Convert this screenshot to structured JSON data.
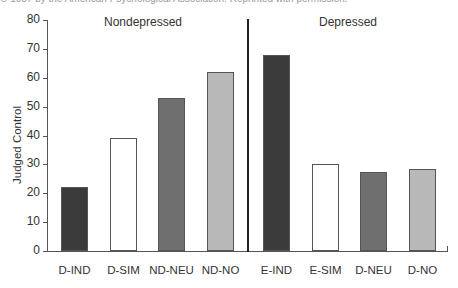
{
  "caption": "© 1987 by the American Psychological Association. Reprinted with permission.",
  "chart_data": {
    "type": "bar",
    "title": "",
    "xlabel": "",
    "ylabel": "Judged Control",
    "ylim": [
      0,
      80
    ],
    "yticks": [
      0,
      10,
      20,
      30,
      40,
      50,
      60,
      70,
      80
    ],
    "grid": false,
    "groups": [
      {
        "name": "Nondepressed",
        "categories": [
          "D-IND",
          "D-SIM",
          "ND-NEU",
          "ND-NO"
        ],
        "values": [
          22,
          39,
          53,
          62
        ]
      },
      {
        "name": "Depressed",
        "categories": [
          "E-IND",
          "E-SIM",
          "D-NEU",
          "D-NO"
        ],
        "values": [
          68,
          30,
          27.5,
          28.5
        ]
      }
    ],
    "categories": [
      "D-IND",
      "D-SIM",
      "ND-NEU",
      "ND-NO",
      "E-IND",
      "E-SIM",
      "D-NEU",
      "D-NO"
    ],
    "values": [
      22,
      39,
      53,
      62,
      68,
      30,
      27.5,
      28.5
    ],
    "bar_colors": [
      "#3b3b3b",
      "#ffffff",
      "#6f6f6f",
      "#b8b8b8",
      "#3b3b3b",
      "#ffffff",
      "#6f6f6f",
      "#b8b8b8"
    ]
  }
}
